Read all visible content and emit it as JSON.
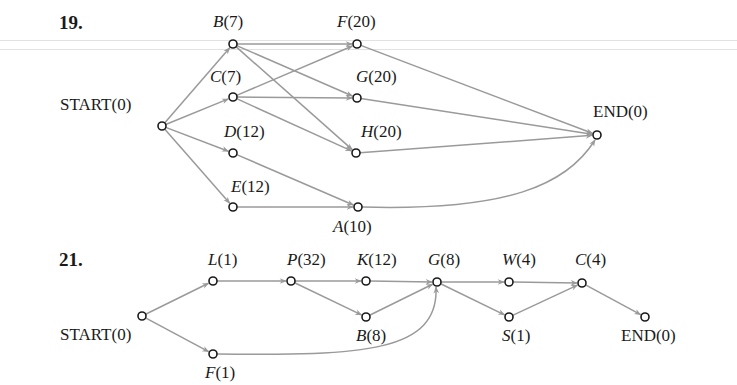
{
  "diagrams": [
    {
      "problem_number": "19.",
      "nodes": [
        {
          "id": "START",
          "name": "START",
          "value": "(0)",
          "italic": false,
          "x": 162,
          "y": 126,
          "lx": 60,
          "ly": 96
        },
        {
          "id": "B",
          "name": "B",
          "value": "(7)",
          "italic": true,
          "x": 233,
          "y": 44,
          "lx": 213,
          "ly": 13
        },
        {
          "id": "C",
          "name": "C",
          "value": "(7)",
          "italic": true,
          "x": 233,
          "y": 97,
          "lx": 210,
          "ly": 68
        },
        {
          "id": "D",
          "name": "D",
          "value": "(12)",
          "italic": true,
          "x": 233,
          "y": 153,
          "lx": 224,
          "ly": 123
        },
        {
          "id": "E",
          "name": "E",
          "value": "(12)",
          "italic": true,
          "x": 233,
          "y": 207,
          "lx": 231,
          "ly": 178
        },
        {
          "id": "F",
          "name": "F",
          "value": "(20)",
          "italic": true,
          "x": 357,
          "y": 44,
          "lx": 337,
          "ly": 13
        },
        {
          "id": "G",
          "name": "G",
          "value": "(20)",
          "italic": true,
          "x": 357,
          "y": 98,
          "lx": 356,
          "ly": 68
        },
        {
          "id": "H",
          "name": "H",
          "value": "(20)",
          "italic": true,
          "x": 356,
          "y": 153,
          "lx": 361,
          "ly": 123
        },
        {
          "id": "A",
          "name": "A",
          "value": "(10)",
          "italic": true,
          "x": 358,
          "y": 207,
          "lx": 333,
          "ly": 218
        },
        {
          "id": "END",
          "name": "END",
          "value": "(0)",
          "italic": false,
          "x": 597,
          "y": 135,
          "lx": 593,
          "ly": 103
        }
      ],
      "edges": [
        [
          "START",
          "B"
        ],
        [
          "START",
          "C"
        ],
        [
          "START",
          "D"
        ],
        [
          "START",
          "E"
        ],
        [
          "B",
          "F"
        ],
        [
          "B",
          "G"
        ],
        [
          "B",
          "H"
        ],
        [
          "C",
          "F"
        ],
        [
          "C",
          "G"
        ],
        [
          "C",
          "H"
        ],
        [
          "D",
          "A"
        ],
        [
          "E",
          "A"
        ],
        [
          "F",
          "END"
        ],
        [
          "G",
          "END"
        ],
        [
          "H",
          "END"
        ],
        [
          "A",
          "END",
          "curve"
        ]
      ]
    },
    {
      "problem_number": "21.",
      "nodes": [
        {
          "id": "START",
          "name": "START",
          "value": "(0)",
          "italic": false,
          "x": 142,
          "y": 316,
          "lx": 60,
          "ly": 326
        },
        {
          "id": "L",
          "name": "L",
          "value": "(1)",
          "italic": true,
          "x": 213,
          "y": 281,
          "lx": 208,
          "ly": 251
        },
        {
          "id": "F",
          "name": "F",
          "value": "(1)",
          "italic": true,
          "x": 213,
          "y": 354,
          "lx": 205,
          "ly": 364
        },
        {
          "id": "P",
          "name": "P",
          "value": "(32)",
          "italic": true,
          "x": 291,
          "y": 281,
          "lx": 287,
          "ly": 251
        },
        {
          "id": "K",
          "name": "K",
          "value": "(12)",
          "italic": true,
          "x": 366,
          "y": 281,
          "lx": 357,
          "ly": 251
        },
        {
          "id": "B",
          "name": "B",
          "value": "(8)",
          "italic": true,
          "x": 366,
          "y": 317,
          "lx": 356,
          "ly": 327
        },
        {
          "id": "G",
          "name": "G",
          "value": "(8)",
          "italic": true,
          "x": 437,
          "y": 282,
          "lx": 428,
          "ly": 251
        },
        {
          "id": "W",
          "name": "W",
          "value": "(4)",
          "italic": true,
          "x": 509,
          "y": 282,
          "lx": 502,
          "ly": 251
        },
        {
          "id": "S",
          "name": "S",
          "value": "(1)",
          "italic": true,
          "x": 509,
          "y": 317,
          "lx": 502,
          "ly": 327
        },
        {
          "id": "C",
          "name": "C",
          "value": "(4)",
          "italic": true,
          "x": 582,
          "y": 283,
          "lx": 575,
          "ly": 251
        },
        {
          "id": "END",
          "name": "END",
          "value": "(0)",
          "italic": false,
          "x": 645,
          "y": 317,
          "lx": 621,
          "ly": 327
        }
      ],
      "edges": [
        [
          "START",
          "L"
        ],
        [
          "START",
          "F"
        ],
        [
          "L",
          "P"
        ],
        [
          "P",
          "K"
        ],
        [
          "P",
          "B"
        ],
        [
          "K",
          "G"
        ],
        [
          "B",
          "G"
        ],
        [
          "F",
          "G",
          "curve"
        ],
        [
          "G",
          "W"
        ],
        [
          "G",
          "S"
        ],
        [
          "W",
          "C"
        ],
        [
          "S",
          "C"
        ],
        [
          "C",
          "END"
        ]
      ]
    }
  ],
  "style": {
    "edge_color": "#9a9a9a",
    "node_stroke": "#1a1a1a",
    "text_color": "#1a1a1a"
  },
  "labels": {
    "p19": "19.",
    "p21": "21."
  }
}
